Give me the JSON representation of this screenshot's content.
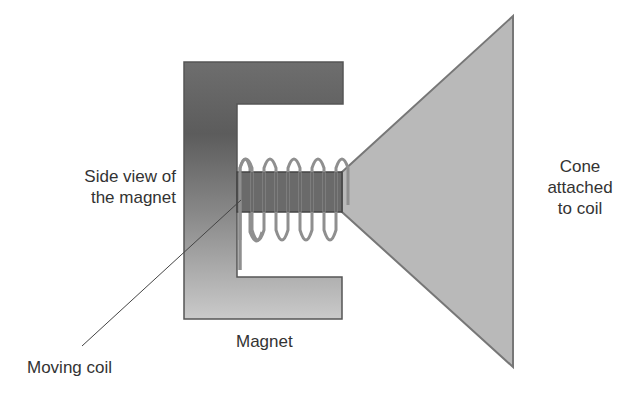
{
  "figure": {
    "type": "loudspeaker-schematic",
    "labels": {
      "side_view": [
        "Side view of",
        "the magnet"
      ],
      "cone": [
        "Cone",
        "attached",
        "to coil"
      ],
      "magnet": "Magnet",
      "moving_coil": "Moving coil"
    },
    "colors": {
      "magnet_top": "#6e6e6e",
      "magnet_dark": "#5a5a5a",
      "magnet_bottom": "#cacaca",
      "cone_fill": "#b9b9b9",
      "outline": "#555555",
      "coil": "#8a8a8a",
      "pointer": "#444444",
      "text": "#333333"
    },
    "coil_loops": 6
  }
}
